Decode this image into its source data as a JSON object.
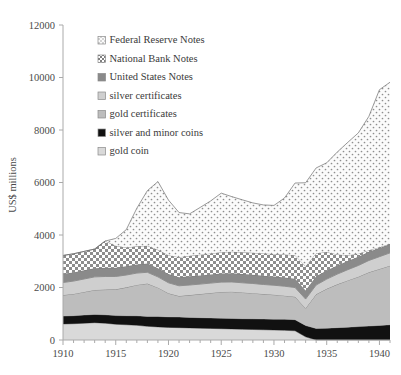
{
  "chart_data": {
    "type": "area",
    "title": "",
    "xlabel": "",
    "ylabel": "US$ millions",
    "ylim": [
      0,
      12000
    ],
    "xlim": [
      1910,
      1941
    ],
    "ytick_labels": [
      "0",
      "2000",
      "4000",
      "6000",
      "8000",
      "10000",
      "12000"
    ],
    "ytick_values": [
      0,
      2000,
      4000,
      6000,
      8000,
      10000,
      12000
    ],
    "xtick_labels": [
      "1910",
      "1915",
      "1920",
      "1925",
      "1930",
      "1935",
      "1940"
    ],
    "xtick_values": [
      1910,
      1915,
      1920,
      1925,
      1930,
      1935,
      1940
    ],
    "minor_xticks_every": 1,
    "grid": false,
    "stacked": true,
    "legend_position": "upper-left-inside",
    "x": [
      1910,
      1911,
      1912,
      1913,
      1914,
      1915,
      1916,
      1917,
      1918,
      1919,
      1920,
      1921,
      1922,
      1923,
      1924,
      1925,
      1926,
      1927,
      1928,
      1929,
      1930,
      1931,
      1932,
      1933,
      1934,
      1935,
      1936,
      1937,
      1938,
      1939,
      1940,
      1941
    ],
    "series": [
      {
        "name": "gold coin",
        "pattern": "light-gray-solid",
        "color": "#d9d9d9",
        "values": [
          610,
          620,
          640,
          660,
          640,
          600,
          580,
          560,
          520,
          500,
          480,
          470,
          460,
          450,
          440,
          430,
          420,
          410,
          400,
          390,
          380,
          370,
          350,
          120,
          0,
          0,
          0,
          0,
          0,
          0,
          0,
          0
        ]
      },
      {
        "name": "silver and minor coins",
        "pattern": "black-solid",
        "color": "#111111",
        "values": [
          300,
          305,
          310,
          315,
          320,
          330,
          345,
          360,
          380,
          395,
          400,
          405,
          400,
          400,
          400,
          400,
          400,
          400,
          405,
          410,
          415,
          420,
          425,
          430,
          440,
          450,
          470,
          490,
          510,
          530,
          555,
          580
        ]
      },
      {
        "name": "gold certificates",
        "pattern": "mid-gray-solid",
        "color": "#bdbdbd",
        "values": [
          800,
          830,
          880,
          930,
          960,
          1000,
          1080,
          1180,
          1250,
          1100,
          900,
          800,
          850,
          900,
          950,
          1000,
          1020,
          1000,
          980,
          950,
          930,
          900,
          870,
          660,
          1300,
          1500,
          1650,
          1780,
          1900,
          2050,
          2150,
          2250
        ]
      },
      {
        "name": "silver certificates",
        "pattern": "lighter-gray-solid",
        "color": "#cfcfcf",
        "values": [
          480,
          490,
          495,
          500,
          500,
          490,
          470,
          450,
          430,
          410,
          400,
          390,
          385,
          380,
          378,
          375,
          372,
          370,
          368,
          365,
          362,
          360,
          355,
          350,
          355,
          370,
          390,
          410,
          430,
          450,
          470,
          490
        ]
      },
      {
        "name": "United States Notes",
        "pattern": "dark-gray-solid",
        "color": "#8a8a8a",
        "values": [
          330,
          330,
          330,
          330,
          330,
          330,
          330,
          330,
          330,
          330,
          330,
          330,
          330,
          330,
          330,
          330,
          330,
          330,
          330,
          330,
          330,
          330,
          330,
          330,
          330,
          330,
          330,
          330,
          330,
          330,
          330,
          330
        ]
      },
      {
        "name": "National Bank Notes",
        "pattern": "checkerboard",
        "color": "#b5b5b5",
        "values": [
          700,
          710,
          720,
          730,
          1020,
          840,
          720,
          690,
          680,
          700,
          720,
          760,
          780,
          790,
          800,
          810,
          820,
          830,
          840,
          850,
          860,
          880,
          900,
          920,
          880,
          700,
          420,
          220,
          120,
          60,
          30,
          20
        ]
      },
      {
        "name": "Federal Reserve Notes",
        "pattern": "dotted",
        "color": "#f4f4f4",
        "values": [
          0,
          0,
          0,
          0,
          0,
          280,
          680,
          1450,
          2100,
          2600,
          2100,
          1700,
          1600,
          1800,
          2000,
          2250,
          2100,
          2000,
          1900,
          1850,
          1850,
          2150,
          2750,
          3180,
          3250,
          3400,
          3900,
          4300,
          4600,
          5100,
          6000,
          6150
        ]
      }
    ]
  },
  "legend": {
    "items": [
      {
        "label": "Federal Reserve Notes",
        "swatch": "dotted"
      },
      {
        "label": "National Bank Notes",
        "swatch": "checkerboard"
      },
      {
        "label": "United States Notes",
        "swatch": "dark-gray-solid"
      },
      {
        "label": "silver certificates",
        "swatch": "lighter-gray-solid"
      },
      {
        "label": "gold certificates",
        "swatch": "mid-gray-solid"
      },
      {
        "label": "silver and minor coins",
        "swatch": "black-solid"
      },
      {
        "label": "gold coin",
        "swatch": "light-gray-solid"
      }
    ]
  },
  "colors": {
    "axis": "#aaaaaa",
    "text": "#3a3a3a",
    "background": "#ffffff"
  }
}
